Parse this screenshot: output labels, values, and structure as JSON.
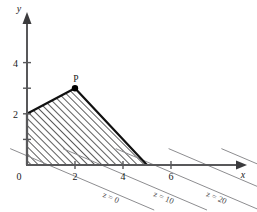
{
  "figure": {
    "title": "",
    "axes": {
      "x_label": "x",
      "y_label": "y",
      "origin_label": "0"
    },
    "x_ticks": [
      {
        "value": 2,
        "label": "2"
      },
      {
        "value": 4,
        "label": "4"
      },
      {
        "value": 6,
        "label": "6"
      }
    ],
    "y_ticks": [
      {
        "value": 1,
        "label": ""
      },
      {
        "value": 2,
        "label": "2"
      },
      {
        "value": 3,
        "label": ""
      },
      {
        "value": 4,
        "label": "4"
      }
    ],
    "vertex": {
      "label": "P",
      "x": 2,
      "y": 3
    }
  },
  "chart_data": {
    "type": "line",
    "title": "",
    "xlabel": "x",
    "ylabel": "y",
    "xlim": [
      -0.8,
      8.6
    ],
    "ylim": [
      -1.4,
      5.6
    ],
    "grid": false,
    "legend": "none",
    "feasible_region": {
      "name": "feasible-region",
      "shaded": true,
      "hatch": "diagonal",
      "vertices": [
        {
          "x": 0,
          "y": 0
        },
        {
          "x": 0,
          "y": 2
        },
        {
          "x": 2,
          "y": 3
        },
        {
          "x": 5,
          "y": 0
        }
      ]
    },
    "objective_slope": -0.4,
    "level_lines": [
      {
        "label": "z = 0",
        "value": 0,
        "x_at_y0": 0.9
      },
      {
        "label": "z = 10",
        "value": 10,
        "x_at_y0": 3.1
      },
      {
        "label": "z = 20",
        "value": 20,
        "x_at_y0": 5.3
      },
      {
        "label": "z = 30",
        "value": 30,
        "x_at_y0": 7.5
      },
      {
        "label": "z = 40",
        "value": 40,
        "x_at_y0": 9.7
      },
      {
        "label": "z = 50",
        "value": 50,
        "x_at_y0": 11.9
      }
    ],
    "annotations": [
      {
        "text": "P",
        "x": 2,
        "y": 3,
        "note": "optimal vertex"
      }
    ]
  }
}
